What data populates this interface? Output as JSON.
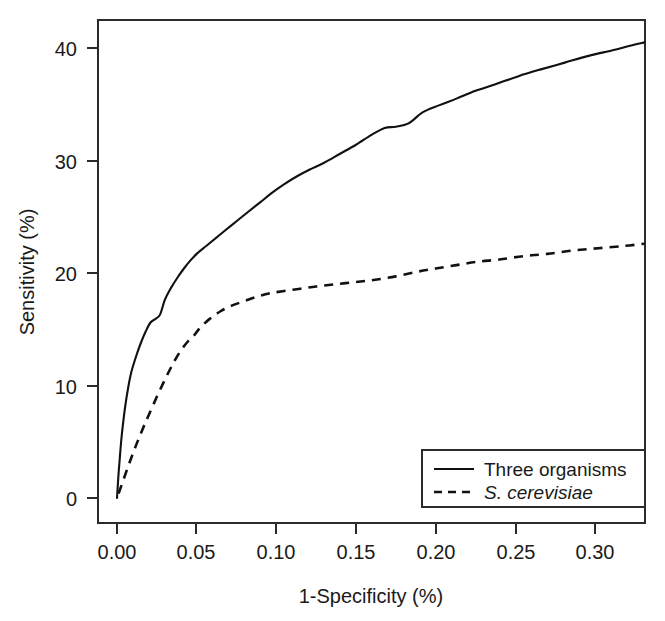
{
  "chart_data": {
    "type": "line",
    "title": "",
    "subtitle": "",
    "xlabel": "1-Specificity (%)",
    "ylabel": "Sensitivity (%)",
    "xlim": [
      0.0,
      0.331
    ],
    "ylim": [
      0,
      42
    ],
    "grid": false,
    "legend_position": "bottom-right",
    "xticks": [
      0.0,
      0.05,
      0.1,
      0.15,
      0.2,
      0.25,
      0.3
    ],
    "xtick_labels": [
      "0.00",
      "0.05",
      "0.10",
      "0.15",
      "0.20",
      "0.25",
      "0.30"
    ],
    "yticks": [
      0,
      10,
      20,
      30,
      40
    ],
    "ytick_labels": [
      "0",
      "10",
      "20",
      "30",
      "40"
    ],
    "series": [
      {
        "name": "Three organisms",
        "style": "solid",
        "color": "#111111",
        "x": [
          0.0,
          0.001,
          0.002,
          0.003,
          0.005,
          0.007,
          0.009,
          0.012,
          0.015,
          0.018,
          0.021,
          0.024,
          0.027,
          0.03,
          0.034,
          0.038,
          0.042,
          0.046,
          0.05,
          0.056,
          0.062,
          0.068,
          0.075,
          0.082,
          0.09,
          0.097,
          0.105,
          0.113,
          0.121,
          0.13,
          0.14,
          0.15,
          0.16,
          0.168,
          0.175,
          0.183,
          0.192,
          0.202,
          0.213,
          0.225,
          0.238,
          0.252,
          0.266,
          0.281,
          0.296,
          0.311,
          0.322,
          0.331
        ],
        "y": [
          0.0,
          2.2,
          4.0,
          5.6,
          8.0,
          9.8,
          11.2,
          12.6,
          13.8,
          14.8,
          15.6,
          15.9,
          16.3,
          17.6,
          18.7,
          19.6,
          20.4,
          21.1,
          21.7,
          22.4,
          23.1,
          23.8,
          24.6,
          25.4,
          26.3,
          27.1,
          27.9,
          28.6,
          29.2,
          29.8,
          30.6,
          31.4,
          32.3,
          32.9,
          33.0,
          33.3,
          34.3,
          34.9,
          35.5,
          36.2,
          36.8,
          37.5,
          38.1,
          38.7,
          39.3,
          39.8,
          40.2,
          40.5
        ]
      },
      {
        "name": "S. cerevisiae",
        "style": "dashed",
        "color": "#111111",
        "italic": true,
        "x": [
          0.001,
          0.004,
          0.008,
          0.012,
          0.016,
          0.02,
          0.025,
          0.03,
          0.035,
          0.04,
          0.045,
          0.048,
          0.052,
          0.058,
          0.065,
          0.072,
          0.08,
          0.088,
          0.096,
          0.105,
          0.115,
          0.125,
          0.137,
          0.15,
          0.162,
          0.175,
          0.188,
          0.2,
          0.213,
          0.226,
          0.24,
          0.255,
          0.27,
          0.286,
          0.302,
          0.318,
          0.331
        ],
        "y": [
          0.4,
          1.6,
          3.2,
          4.7,
          6.1,
          7.4,
          9.0,
          10.5,
          11.9,
          13.1,
          14.0,
          14.4,
          15.1,
          15.9,
          16.6,
          17.1,
          17.5,
          17.9,
          18.2,
          18.4,
          18.6,
          18.8,
          19.0,
          19.2,
          19.4,
          19.7,
          20.1,
          20.4,
          20.7,
          21.0,
          21.2,
          21.5,
          21.7,
          22.0,
          22.2,
          22.4,
          22.6
        ]
      }
    ],
    "legend": [
      {
        "label": "Three organisms",
        "style": "solid",
        "italic": false
      },
      {
        "label": "S. cerevisiae",
        "style": "dashed",
        "italic": true
      }
    ]
  }
}
